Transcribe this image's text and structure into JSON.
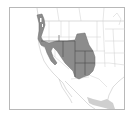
{
  "map": {
    "type": "species-range-map",
    "region": "Western North America",
    "colors": {
      "background": "#ffffff",
      "frame": "#b8b8b8",
      "border_lines": "#c8c8c8",
      "range_primary": "#8c8c8c",
      "range_primary_border": "#555555",
      "range_secondary": "#cfcfcf"
    },
    "layers": [
      {
        "name": "primary-range",
        "description": "Dark gray range covering Pacific Northwest coast, Great Basin, Four Corners states"
      },
      {
        "name": "secondary-range",
        "description": "Light gray range in western Mexico"
      }
    ]
  }
}
